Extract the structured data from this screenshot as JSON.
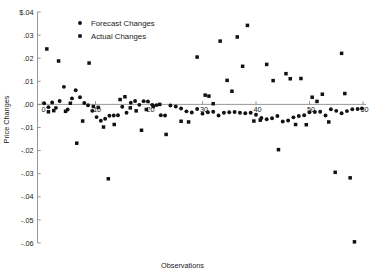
{
  "chart_data": {
    "type": "scatter",
    "title": "",
    "xlabel": "Observations",
    "ylabel": "Price Changes",
    "xlim": [
      0,
      60
    ],
    "ylim": [
      -0.06,
      0.04
    ],
    "grid": false,
    "legend_position": "top-left-inside",
    "xticks": [
      0,
      10,
      20,
      30,
      40,
      50,
      60
    ],
    "xtick_labels": [
      "0",
      "10",
      "20",
      "30",
      "40",
      "50",
      "60"
    ],
    "yticks": [
      0.04,
      0.03,
      0.02,
      0.01,
      0.0,
      -0.01,
      -0.02,
      -0.03,
      -0.04,
      -0.05,
      -0.06
    ],
    "ytick_labels": [
      "$.04",
      ".03",
      ".02",
      ".01",
      ".00",
      "-.01",
      "-.02",
      "-.03",
      "-.04",
      "-.05",
      "-.06"
    ],
    "zero_line": 0.0,
    "series": [
      {
        "name": "Forecast Changes",
        "marker": "circle",
        "color": "#111111",
        "points": [
          [
            0.4,
            0.0005
          ],
          [
            1.2,
            -0.0012
          ],
          [
            1.9,
            0.0008
          ],
          [
            2.6,
            -0.0015
          ],
          [
            3.3,
            0.0015
          ],
          [
            4.1,
            0.0076
          ],
          [
            4.8,
            -0.0022
          ],
          [
            5.6,
            0.0026
          ],
          [
            6.3,
            0.0061
          ],
          [
            7.1,
            0.0031
          ],
          [
            7.9,
            0.0006
          ],
          [
            8.6,
            -0.0004
          ],
          [
            9.4,
            -0.0028
          ],
          [
            10.2,
            -0.0055
          ],
          [
            11.0,
            -0.0071
          ],
          [
            11.8,
            -0.0062
          ],
          [
            12.6,
            -0.0049
          ],
          [
            13.4,
            -0.0048
          ],
          [
            14.2,
            -0.0047
          ],
          [
            15.0,
            -0.001
          ],
          [
            15.8,
            -0.0036
          ],
          [
            16.6,
            0.0007
          ],
          [
            17.4,
            0.0015
          ],
          [
            18.2,
            -0.0002
          ],
          [
            19.0,
            0.0014
          ],
          [
            19.8,
            0.0013
          ],
          [
            20.6,
            -0.0002
          ],
          [
            21.4,
            -0.0003
          ],
          [
            22.2,
            -0.0047
          ],
          [
            23.0,
            -0.0048
          ],
          [
            24.0,
            -0.0005
          ],
          [
            25.0,
            -0.0009
          ],
          [
            26.0,
            -0.0018
          ],
          [
            27.0,
            -0.003
          ],
          [
            28.0,
            -0.0035
          ],
          [
            29.0,
            -0.002
          ],
          [
            30.0,
            -0.004
          ],
          [
            31.0,
            -0.0034
          ],
          [
            32.0,
            -0.0032
          ],
          [
            33.0,
            -0.0048
          ],
          [
            34.0,
            -0.0036
          ],
          [
            35.0,
            -0.0034
          ],
          [
            36.0,
            -0.0033
          ],
          [
            37.0,
            -0.0036
          ],
          [
            38.0,
            -0.0038
          ],
          [
            39.0,
            -0.0036
          ],
          [
            40.0,
            -0.0045
          ],
          [
            41.0,
            -0.0059
          ],
          [
            42.0,
            -0.0064
          ],
          [
            43.0,
            -0.006
          ],
          [
            44.0,
            -0.005
          ],
          [
            45.0,
            -0.0074
          ],
          [
            46.0,
            -0.007
          ],
          [
            47.0,
            -0.0056
          ],
          [
            48.0,
            -0.005
          ],
          [
            49.0,
            -0.0047
          ],
          [
            50.0,
            -0.0034
          ],
          [
            51.0,
            -0.0033
          ],
          [
            52.0,
            -0.0032
          ],
          [
            53.0,
            -0.0048
          ],
          [
            54.0,
            -0.0021
          ],
          [
            55.0,
            -0.0028
          ],
          [
            56.0,
            -0.0038
          ],
          [
            57.0,
            -0.0029
          ],
          [
            58.0,
            -0.0021
          ],
          [
            59.0,
            -0.002
          ],
          [
            59.8,
            -0.0017
          ]
        ]
      },
      {
        "name": "Actual Changes",
        "marker": "square",
        "color": "#111111",
        "points": [
          [
            0.9,
            0.024
          ],
          [
            1.2,
            -0.0032
          ],
          [
            2.2,
            -0.0027
          ],
          [
            3.1,
            0.0188
          ],
          [
            4.4,
            -0.003
          ],
          [
            5.3,
            0.0005
          ],
          [
            6.5,
            -0.0168
          ],
          [
            7.6,
            -0.0072
          ],
          [
            8.8,
            0.0179
          ],
          [
            9.6,
            -0.0009
          ],
          [
            10.5,
            -0.0013
          ],
          [
            11.5,
            -0.0098
          ],
          [
            12.4,
            -0.0322
          ],
          [
            13.5,
            -0.0087
          ],
          [
            14.6,
            0.0021
          ],
          [
            15.5,
            0.0033
          ],
          [
            16.5,
            -0.0015
          ],
          [
            17.6,
            -0.0028
          ],
          [
            18.6,
            -0.0112
          ],
          [
            19.5,
            -0.0022
          ],
          [
            20.8,
            -0.0009
          ],
          [
            22.0,
            0.0
          ],
          [
            23.2,
            -0.013
          ],
          [
            26.0,
            -0.0073
          ],
          [
            27.4,
            -0.0076
          ],
          [
            29.0,
            0.0205
          ],
          [
            30.5,
            0.004
          ],
          [
            31.2,
            0.0036
          ],
          [
            32.0,
            0.0003
          ],
          [
            33.3,
            0.0274
          ],
          [
            34.6,
            0.0104
          ],
          [
            35.5,
            0.0057
          ],
          [
            36.5,
            0.0292
          ],
          [
            37.5,
            0.0165
          ],
          [
            38.4,
            0.0342
          ],
          [
            39.6,
            -0.0072
          ],
          [
            40.8,
            -0.0068
          ],
          [
            42.0,
            0.0173
          ],
          [
            43.2,
            0.0103
          ],
          [
            44.2,
            -0.0196
          ],
          [
            45.6,
            0.0133
          ],
          [
            46.4,
            0.0111
          ],
          [
            47.4,
            -0.0087
          ],
          [
            48.4,
            0.0112
          ],
          [
            49.4,
            -0.0088
          ],
          [
            50.5,
            0.0031
          ],
          [
            51.4,
            0.0013
          ],
          [
            52.4,
            0.0044
          ],
          [
            53.6,
            -0.0076
          ],
          [
            54.8,
            -0.0294
          ],
          [
            56.0,
            0.0221
          ],
          [
            56.6,
            0.0047
          ],
          [
            57.6,
            -0.0318
          ],
          [
            58.4,
            -0.0595
          ]
        ]
      }
    ]
  },
  "legend": {
    "items": [
      {
        "label": "Forecast Changes",
        "marker": "circle"
      },
      {
        "label": "Actual Changes",
        "marker": "square"
      }
    ]
  }
}
